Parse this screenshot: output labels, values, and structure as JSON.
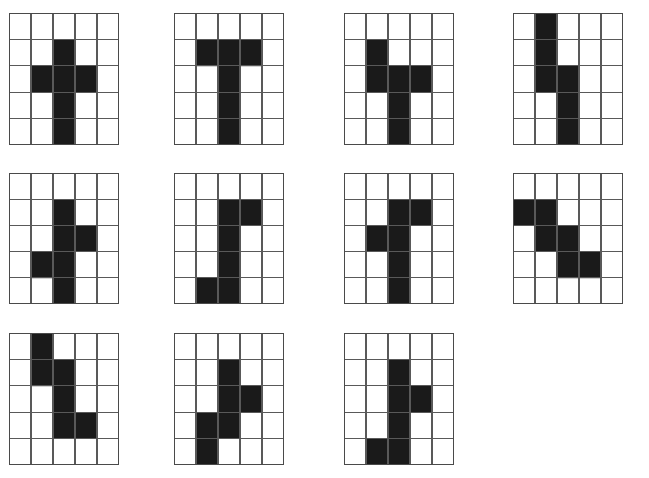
{
  "page": {
    "background_color": "#ffffff",
    "fill_color": "#1a1a1a",
    "line_color": "#595959",
    "grid_rows": 5,
    "grid_cols": 5,
    "panel_count": 11,
    "layout_rows": [
      4,
      4,
      3
    ]
  },
  "figures": [
    {
      "id": "figure-1",
      "label": "Figure 1",
      "shape_name": "plus-cross",
      "cell_count": 6,
      "cells": [
        [
          1,
          2
        ],
        [
          2,
          1
        ],
        [
          2,
          2
        ],
        [
          2,
          3
        ],
        [
          3,
          2
        ],
        [
          4,
          2
        ]
      ],
      "position": {
        "left": 9,
        "top": 13,
        "width": 110,
        "height": 132
      }
    },
    {
      "id": "figure-2",
      "label": "Figure 2",
      "shape_name": "tee-upright",
      "cell_count": 6,
      "cells": [
        [
          1,
          1
        ],
        [
          1,
          2
        ],
        [
          1,
          3
        ],
        [
          2,
          2
        ],
        [
          3,
          2
        ],
        [
          4,
          2
        ]
      ],
      "position": {
        "left": 174,
        "top": 13,
        "width": 110,
        "height": 132
      }
    },
    {
      "id": "figure-3",
      "label": "Figure 3",
      "shape_name": "cross-left-arm-up",
      "cell_count": 6,
      "cells": [
        [
          1,
          1
        ],
        [
          2,
          1
        ],
        [
          2,
          2
        ],
        [
          2,
          3
        ],
        [
          3,
          2
        ],
        [
          4,
          2
        ]
      ],
      "position": {
        "left": 344,
        "top": 13,
        "width": 110,
        "height": 132
      }
    },
    {
      "id": "figure-4",
      "label": "Figure 4",
      "shape_name": "s-zigzag-vertical",
      "cell_count": 6,
      "cells": [
        [
          0,
          1
        ],
        [
          1,
          1
        ],
        [
          2,
          1
        ],
        [
          2,
          2
        ],
        [
          3,
          2
        ],
        [
          4,
          2
        ]
      ],
      "position": {
        "left": 513,
        "top": 13,
        "width": 110,
        "height": 132
      }
    },
    {
      "id": "figure-5",
      "label": "Figure 5",
      "shape_name": "offset-cross-right-left",
      "cell_count": 6,
      "cells": [
        [
          1,
          2
        ],
        [
          2,
          2
        ],
        [
          2,
          3
        ],
        [
          3,
          1
        ],
        [
          3,
          2
        ],
        [
          4,
          2
        ]
      ],
      "position": {
        "left": 9,
        "top": 173,
        "width": 110,
        "height": 131
      }
    },
    {
      "id": "figure-6",
      "label": "Figure 6",
      "shape_name": "jay-hook",
      "cell_count": 6,
      "cells": [
        [
          1,
          2
        ],
        [
          1,
          3
        ],
        [
          2,
          2
        ],
        [
          3,
          2
        ],
        [
          4,
          1
        ],
        [
          4,
          2
        ]
      ],
      "position": {
        "left": 174,
        "top": 173,
        "width": 110,
        "height": 131
      }
    },
    {
      "id": "figure-7",
      "label": "Figure 7",
      "shape_name": "tee-with-left-notch",
      "cell_count": 6,
      "cells": [
        [
          1,
          2
        ],
        [
          1,
          3
        ],
        [
          2,
          1
        ],
        [
          2,
          2
        ],
        [
          3,
          2
        ],
        [
          4,
          2
        ]
      ],
      "position": {
        "left": 344,
        "top": 173,
        "width": 110,
        "height": 131
      }
    },
    {
      "id": "figure-8",
      "label": "Figure 8",
      "shape_name": "staircase-descending",
      "cell_count": 6,
      "cells": [
        [
          1,
          0
        ],
        [
          1,
          1
        ],
        [
          2,
          1
        ],
        [
          2,
          2
        ],
        [
          3,
          2
        ],
        [
          3,
          3
        ]
      ],
      "position": {
        "left": 513,
        "top": 173,
        "width": 110,
        "height": 131
      }
    },
    {
      "id": "figure-9",
      "label": "Figure 9",
      "shape_name": "zigzag-step-right",
      "cell_count": 6,
      "cells": [
        [
          0,
          1
        ],
        [
          1,
          1
        ],
        [
          1,
          2
        ],
        [
          2,
          2
        ],
        [
          3,
          2
        ],
        [
          3,
          3
        ]
      ],
      "position": {
        "left": 9,
        "top": 333,
        "width": 110,
        "height": 132
      }
    },
    {
      "id": "figure-10",
      "label": "Figure 10",
      "shape_name": "zigzag-cross-lower-left",
      "cell_count": 6,
      "cells": [
        [
          1,
          2
        ],
        [
          2,
          2
        ],
        [
          2,
          3
        ],
        [
          3,
          1
        ],
        [
          3,
          2
        ],
        [
          4,
          1
        ]
      ],
      "position": {
        "left": 174,
        "top": 333,
        "width": 110,
        "height": 132
      }
    },
    {
      "id": "figure-11",
      "label": "Figure 11",
      "shape_name": "jay-with-right-arm",
      "cell_count": 6,
      "cells": [
        [
          1,
          2
        ],
        [
          2,
          2
        ],
        [
          2,
          3
        ],
        [
          3,
          2
        ],
        [
          4,
          1
        ],
        [
          4,
          2
        ]
      ],
      "position": {
        "left": 344,
        "top": 333,
        "width": 110,
        "height": 132
      }
    }
  ]
}
